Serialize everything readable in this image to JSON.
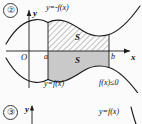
{
  "figure": {
    "background_color": "#fbfbfb",
    "stroke_color": "#1a1a1a",
    "hatch_color": "#7a7a7a",
    "fill_color": "#c9c9c9"
  },
  "items": [
    {
      "number": "②",
      "axis": {
        "y_label": "y",
        "x_label": "x",
        "origin_label": "O",
        "ticks": [
          {
            "label": "a"
          },
          {
            "label": "b"
          }
        ]
      },
      "curves": [
        {
          "label": "y=-f(x)",
          "role": "reflected-curve"
        },
        {
          "label": "y=f(x)",
          "role": "original-curve"
        }
      ],
      "regions": [
        {
          "label": "S",
          "role": "hatched-area-above-axis"
        },
        {
          "label": "S",
          "role": "filled-area-below-axis"
        }
      ],
      "condition": "f(x)≤0"
    },
    {
      "number": "③",
      "axis": {
        "y_label": "y"
      },
      "curves": [
        {
          "label": "y=f(x)",
          "role": "original-curve"
        }
      ]
    }
  ]
}
